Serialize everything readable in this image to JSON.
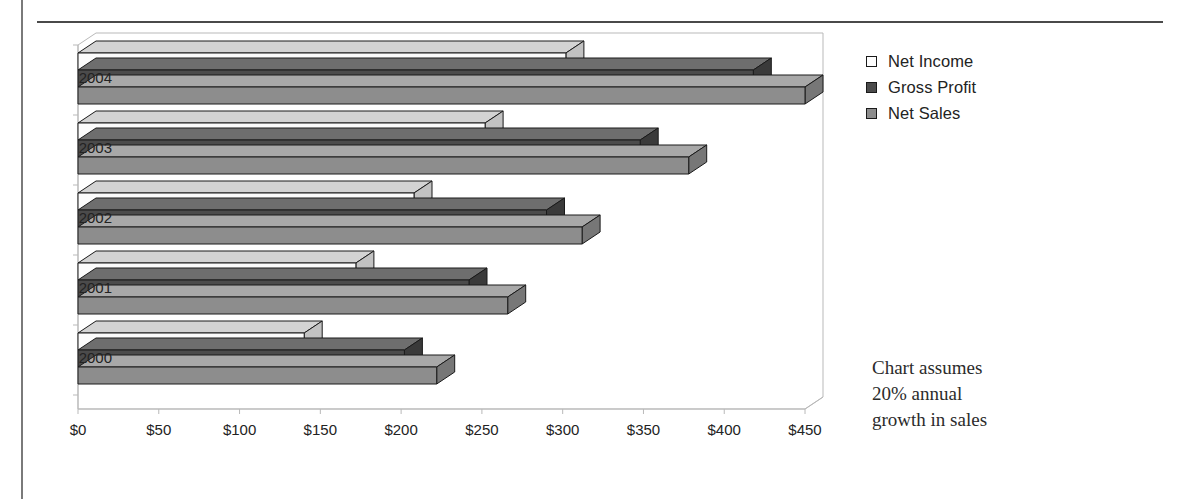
{
  "chart_data": {
    "type": "bar",
    "orientation": "horizontal",
    "style": "3d-stacked-rows",
    "title": "",
    "xlabel": "",
    "ylabel": "",
    "categories": [
      "2000",
      "2001",
      "2002",
      "2003",
      "2004"
    ],
    "series": [
      {
        "name": "Net Income",
        "values": [
          140,
          172,
          208,
          252,
          302
        ],
        "color": "#f2f2f2"
      },
      {
        "name": "Gross Profit",
        "values": [
          202,
          242,
          290,
          348,
          418
        ],
        "color": "#545454"
      },
      {
        "name": "Net Sales",
        "values": [
          222,
          266,
          312,
          378,
          450
        ],
        "color": "#8d8d8d"
      }
    ],
    "xlim": [
      0,
      450
    ],
    "xticks": [
      0,
      50,
      100,
      150,
      200,
      250,
      300,
      350,
      400,
      450
    ],
    "xtick_labels": [
      "$0",
      "$50",
      "$100",
      "$150",
      "$200",
      "$250",
      "$300",
      "$350",
      "$400",
      "$450"
    ],
    "ytick_labels": [
      "2004",
      "2003",
      "2002",
      "2001",
      "2000"
    ],
    "grid": false,
    "legend_position": "right-top",
    "annotation_lines": [
      "Chart assumes",
      "20% annual",
      "growth in sales"
    ]
  },
  "legend": {
    "items": [
      {
        "label": "Net Income",
        "swatch": "#fdfdfd",
        "icon": "legend-swatch-icon"
      },
      {
        "label": "Gross Profit",
        "swatch": "#4b4b4b",
        "icon": "legend-swatch-icon"
      },
      {
        "label": "Net Sales",
        "swatch": "#8d8d8d",
        "icon": "legend-swatch-icon"
      }
    ]
  },
  "note": {
    "line1": "Chart assumes",
    "line2": "20% annual",
    "line3": "growth in sales"
  },
  "colors": {
    "net_income_top": "#d3d3d3",
    "net_income_front": "#fbfbfb",
    "gross_profit_top": "#6e6e6e",
    "gross_profit_front": "#4b4b4b",
    "net_sales_top": "#a8a8a8",
    "net_sales_front": "#8d8d8d",
    "outline": "#1a1a1a",
    "axis": "#b9b9b9",
    "frame_rule": "#4a4a4a"
  }
}
